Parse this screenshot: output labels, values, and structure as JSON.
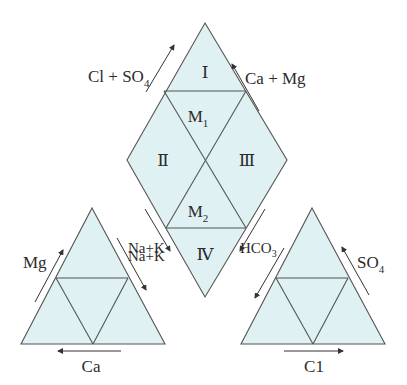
{
  "figure": {
    "type": "Piper trilinear diagram",
    "fill_color": "#dff1f3",
    "line_color": "#555555"
  },
  "diamond": {
    "regions": [
      {
        "id": "I",
        "label": "Ⅰ"
      },
      {
        "id": "M1",
        "label": "M",
        "subscript": "1"
      },
      {
        "id": "II",
        "label": "Ⅱ"
      },
      {
        "id": "III",
        "label": "Ⅲ"
      },
      {
        "id": "M2",
        "label": "M",
        "subscript": "2"
      },
      {
        "id": "IV",
        "label": "Ⅳ"
      }
    ],
    "axes": {
      "upper_left": {
        "label": "Cl + SO",
        "subscript": "4",
        "direction": "up"
      },
      "upper_right": {
        "label": "Ca + Mg",
        "direction": "up"
      },
      "lower_left": {
        "label": "Na+K",
        "direction": "down"
      },
      "lower_right": {
        "label": "HCO",
        "subscript": "3",
        "direction": "down"
      }
    }
  },
  "cation_triangle": {
    "left_axis": {
      "label": "Mg",
      "direction": "up"
    },
    "right_axis": {
      "label": "Na+K",
      "direction": "down"
    },
    "bottom_axis": {
      "label": "Ca",
      "direction": "left"
    }
  },
  "anion_triangle": {
    "left_axis": {
      "label": "HCO",
      "subscript": "3",
      "direction": "down"
    },
    "right_axis": {
      "label": "SO",
      "subscript": "4",
      "direction": "up"
    },
    "bottom_axis": {
      "label": "C1",
      "direction": "right"
    }
  }
}
